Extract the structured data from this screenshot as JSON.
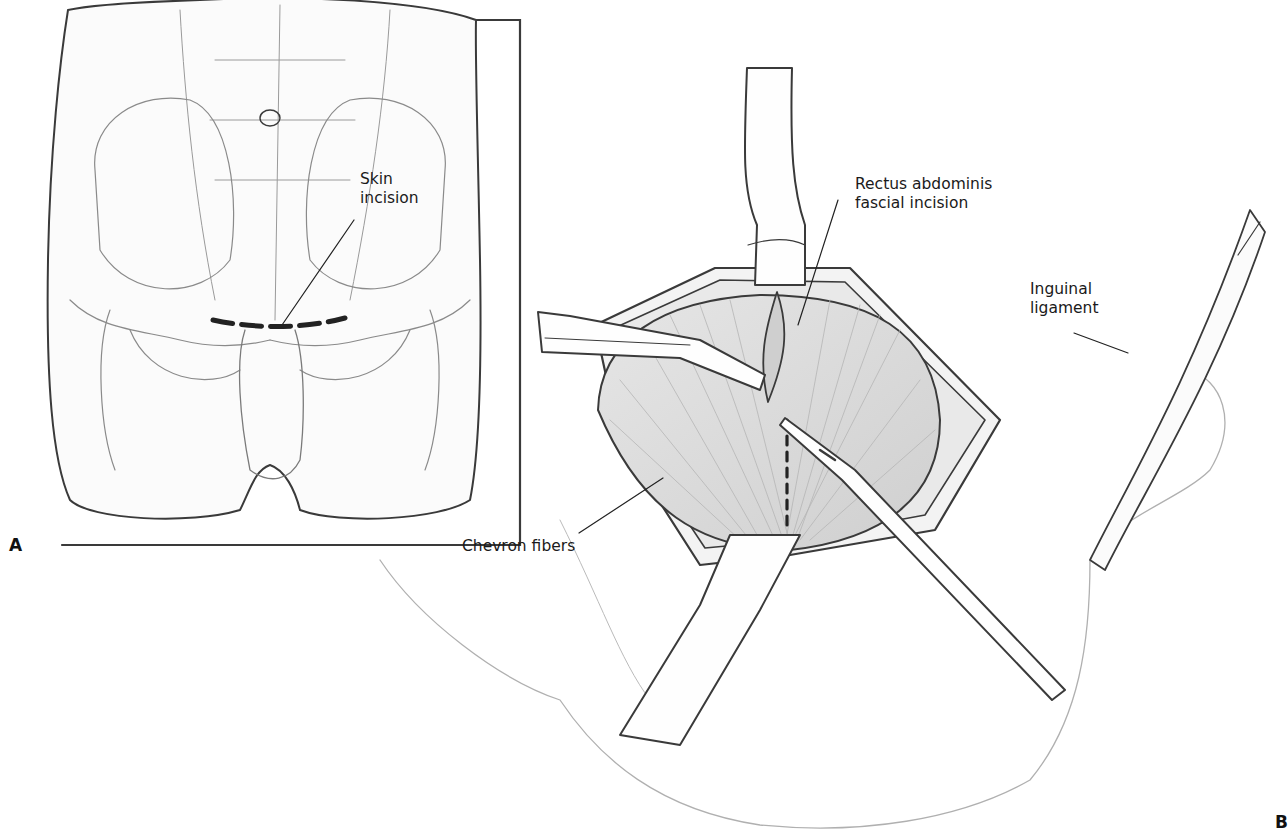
{
  "figure": {
    "panels": [
      {
        "id": "A",
        "letter": "A",
        "description": "Anterior view of lower abdomen and pelvis with skin incision line",
        "labels": [
          {
            "text": "Skin\nincision",
            "x": 360,
            "y": 170
          }
        ]
      },
      {
        "id": "B",
        "letter": "B",
        "description": "Operative field with retractors, scalpel, and rectus fascial incision",
        "labels": [
          {
            "text": "Rectus abdominis\nfascial incision",
            "x": 855,
            "y": 175
          },
          {
            "text": "Inguinal\nligament",
            "x": 1030,
            "y": 280
          },
          {
            "text": "Chevron fibers",
            "x": 462,
            "y": 537
          }
        ]
      }
    ],
    "colors": {
      "line": "#3a3a3a",
      "shade": "#d8d8d8",
      "background": "#ffffff"
    }
  }
}
